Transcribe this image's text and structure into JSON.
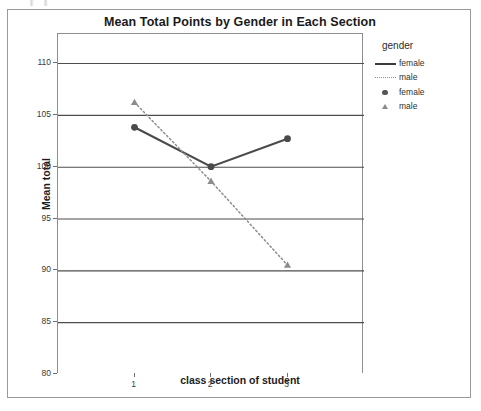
{
  "chart_data": {
    "type": "line",
    "title": "Mean Total Points by Gender in Each Section",
    "xlabel": "class section of student",
    "ylabel": "Mean total",
    "categories": [
      "1",
      "2",
      "3"
    ],
    "x_tick_labels": [
      "1",
      "2",
      "3"
    ],
    "y_tick_labels": [
      "110",
      "105",
      "100",
      "95",
      "90",
      "85",
      "80"
    ],
    "y_tick_values": [
      110,
      105,
      100,
      95,
      90,
      85,
      80
    ],
    "ylim": [
      80,
      112.8
    ],
    "grid": true,
    "grid_axis": "y",
    "legend_position": "right",
    "legend_title": "gender",
    "legend_entries": [
      {
        "label": "female",
        "key": "solid-line"
      },
      {
        "label": "male",
        "key": "dotted-line"
      },
      {
        "label": "female",
        "key": "circle-marker"
      },
      {
        "label": "male",
        "key": "triangle-marker"
      }
    ],
    "series": [
      {
        "name": "female",
        "marker": "circle",
        "line_style": "solid",
        "color": "#4a4a4a",
        "values": [
          103.8,
          100.0,
          102.7
        ]
      },
      {
        "name": "male",
        "marker": "triangle",
        "line_style": "dotted",
        "color": "#8c8c8c",
        "values": [
          106.2,
          98.6,
          90.5
        ]
      }
    ]
  },
  "colors": {
    "female_series": "#4a4a4a",
    "male_series": "#8c8c8c",
    "gridline": "#4d4d4d",
    "axis": "#8e8e8e",
    "frame_border": "#9a9a9a",
    "title_text": "#1a1a1a"
  }
}
